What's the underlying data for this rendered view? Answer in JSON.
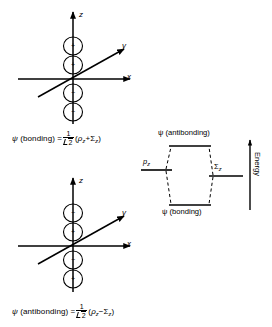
{
  "figure": {
    "background": "#ffffff",
    "ink": "#000000",
    "type": "molecular-orbital-diagram"
  },
  "bonding_orbital": {
    "name": "bonding-orbital-diagram",
    "axes": {
      "z": "z",
      "y": "y",
      "x": "x"
    },
    "lobe_signs": [
      "+",
      "+",
      "−",
      "−"
    ],
    "caption": {
      "psi": "ψ",
      "kind": "(bonding)",
      "equals": "=",
      "numerator": "1",
      "denominator": "2",
      "open": "(",
      "term1": "ρ",
      "term1_sub": "z",
      "operator": "+",
      "term2": "Σ",
      "term2_sub": "z",
      "close": ")"
    }
  },
  "antibonding_orbital": {
    "name": "antibonding-orbital-diagram",
    "axes": {
      "z": "z",
      "y": "y",
      "x": "x"
    },
    "lobe_signs": [
      "−",
      "+",
      "−",
      "+"
    ],
    "caption": {
      "psi": "ψ",
      "kind": "(antibonding)",
      "equals": "=",
      "numerator": "1",
      "denominator": "2",
      "open": "(",
      "term1": "ρ",
      "term1_sub": "z",
      "operator": "−",
      "term2": "Σ",
      "term2_sub": "z",
      "close": ")"
    }
  },
  "energy_diagram": {
    "name": "energy-level-correlation-diagram",
    "top_level_label": "ψ (antibonding)",
    "bottom_level_label": "ψ (bonding)",
    "left_level": {
      "symbol": "p",
      "sub": "z"
    },
    "right_level": {
      "symbol": "Σ",
      "sub": "z"
    },
    "axis_label": "Energy",
    "axis_direction": "up"
  }
}
